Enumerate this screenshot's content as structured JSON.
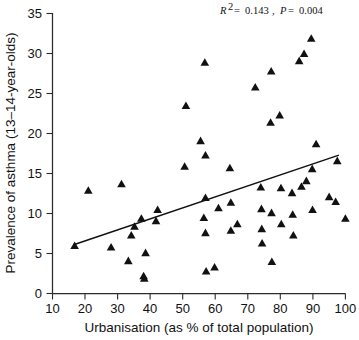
{
  "chart_data": {
    "type": "scatter",
    "title": "",
    "xlabel": "Urbanisation (as % of total population)",
    "ylabel": "Prevalence of asthma (13–14-year-olds)",
    "xlim": [
      10,
      100
    ],
    "ylim": [
      0,
      35
    ],
    "xticks": [
      10,
      20,
      30,
      40,
      50,
      60,
      70,
      80,
      90,
      100
    ],
    "yticks": [
      0,
      5,
      10,
      15,
      20,
      25,
      30,
      35
    ],
    "xtick_labels": [
      "10",
      "20",
      "30",
      "40",
      "50",
      "60",
      "70",
      "80",
      "90",
      "100"
    ],
    "ytick_labels": [
      "0",
      "5",
      "10",
      "15",
      "20",
      "25",
      "30",
      "35"
    ],
    "grid": false,
    "legend": "none",
    "marker": "triangle-up",
    "marker_color": "#111111",
    "annotation": {
      "r_squared_symbol": "R",
      "r_squared_exponent": "2",
      "r_squared_value": "0.143",
      "p_symbol": "P",
      "p_value": "0.004",
      "text": "R2 = 0.143, P = 0.004",
      "position": "top-right"
    },
    "trendline": {
      "label": "linear fit",
      "color": "#111111",
      "x_start": 16.5,
      "y_start": 6.1,
      "x_end": 98.0,
      "y_end": 17.3
    },
    "points": [
      {
        "x": 16.8,
        "y": 6.0
      },
      {
        "x": 21.0,
        "y": 12.9
      },
      {
        "x": 28.0,
        "y": 5.8
      },
      {
        "x": 31.2,
        "y": 13.7
      },
      {
        "x": 33.3,
        "y": 4.1
      },
      {
        "x": 34.2,
        "y": 7.3
      },
      {
        "x": 35.2,
        "y": 8.4
      },
      {
        "x": 37.3,
        "y": 9.4
      },
      {
        "x": 38.0,
        "y": 2.2
      },
      {
        "x": 38.2,
        "y": 1.9
      },
      {
        "x": 38.6,
        "y": 5.1
      },
      {
        "x": 41.8,
        "y": 9.1
      },
      {
        "x": 42.3,
        "y": 10.5
      },
      {
        "x": 50.6,
        "y": 15.9
      },
      {
        "x": 51.0,
        "y": 23.5
      },
      {
        "x": 55.5,
        "y": 19.1
      },
      {
        "x": 56.8,
        "y": 28.9
      },
      {
        "x": 57.0,
        "y": 17.3
      },
      {
        "x": 57.0,
        "y": 12.0
      },
      {
        "x": 56.5,
        "y": 9.5
      },
      {
        "x": 57.0,
        "y": 7.6
      },
      {
        "x": 57.2,
        "y": 2.8
      },
      {
        "x": 59.8,
        "y": 3.3
      },
      {
        "x": 61.0,
        "y": 10.7
      },
      {
        "x": 64.5,
        "y": 15.7
      },
      {
        "x": 64.8,
        "y": 11.4
      },
      {
        "x": 64.8,
        "y": 7.9
      },
      {
        "x": 66.8,
        "y": 8.7
      },
      {
        "x": 72.3,
        "y": 25.8
      },
      {
        "x": 74.0,
        "y": 13.3
      },
      {
        "x": 74.2,
        "y": 10.6
      },
      {
        "x": 74.3,
        "y": 8.1
      },
      {
        "x": 74.4,
        "y": 6.3
      },
      {
        "x": 77.2,
        "y": 27.8
      },
      {
        "x": 77.0,
        "y": 21.4
      },
      {
        "x": 77.3,
        "y": 10.1
      },
      {
        "x": 77.4,
        "y": 4.0
      },
      {
        "x": 79.8,
        "y": 22.3
      },
      {
        "x": 80.2,
        "y": 13.2
      },
      {
        "x": 80.3,
        "y": 8.7
      },
      {
        "x": 83.6,
        "y": 12.6
      },
      {
        "x": 83.8,
        "y": 9.9
      },
      {
        "x": 84.0,
        "y": 7.3
      },
      {
        "x": 85.8,
        "y": 29.1
      },
      {
        "x": 87.3,
        "y": 30.0
      },
      {
        "x": 86.5,
        "y": 13.4
      },
      {
        "x": 88.0,
        "y": 14.1
      },
      {
        "x": 89.5,
        "y": 31.9
      },
      {
        "x": 89.8,
        "y": 15.6
      },
      {
        "x": 89.9,
        "y": 10.5
      },
      {
        "x": 91.0,
        "y": 18.7
      },
      {
        "x": 95.0,
        "y": 12.1
      },
      {
        "x": 97.0,
        "y": 11.5
      },
      {
        "x": 97.5,
        "y": 16.6
      },
      {
        "x": 100.0,
        "y": 9.4
      }
    ]
  },
  "figure": {
    "background": "#ffffff",
    "axis_color": "#2b2b2b"
  }
}
